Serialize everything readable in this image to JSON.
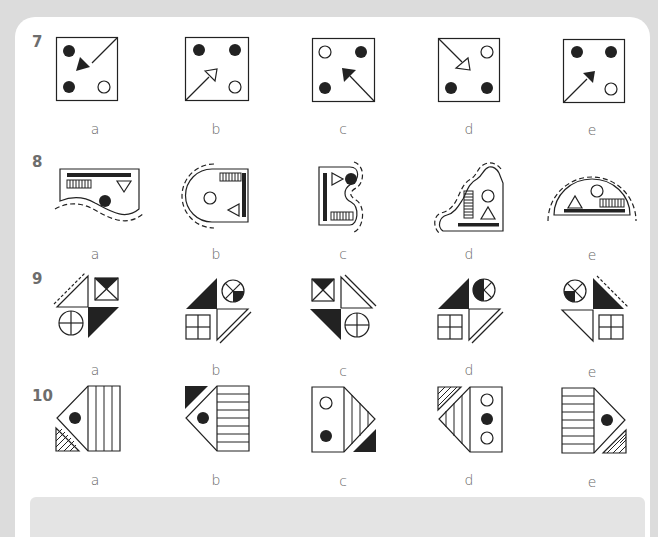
{
  "questions": [
    {
      "number": "7",
      "options": [
        "a",
        "b",
        "c",
        "d",
        "e"
      ]
    },
    {
      "number": "8",
      "options": [
        "a",
        "b",
        "c",
        "d",
        "e"
      ]
    },
    {
      "number": "9",
      "options": [
        "a",
        "b",
        "c",
        "d",
        "e"
      ]
    },
    {
      "number": "10",
      "options": [
        "a",
        "b",
        "c",
        "d",
        "e"
      ]
    }
  ],
  "colors": {
    "background": "#dcdcdc",
    "card": "#ffffff",
    "ink": "#222222",
    "label": "#666666",
    "number": "#6d6d6d"
  },
  "figures": {
    "q7": {
      "a": "square; filled dots top-left, bottom-left; hollow dot bottom-right; filled arrow from top-right corner pointing to centre",
      "b": "square; filled dots top-left, top-right; hollow dot bottom-right; hollow arrow from bottom-left corner pointing to centre",
      "c": "square; hollow dot top-left; filled dots top-right, bottom-left; filled arrow from bottom-right corner pointing to centre",
      "d": "square; hollow dot top-right; filled dots bottom-left, bottom-right; hollow arrow from top-left corner pointing to centre",
      "e": "square; filled dots top-left, top-right; hollow dot bottom-right; filled arrow from bottom-left corner pointing to centre"
    },
    "q8": {
      "a": "wavy bottom edge with dashed outline; bar, striped box, down triangle, filled circle",
      "b": "semicircle left with dashed outline; striped box, vertical bar, circle, left triangle",
      "c": "S-curve right with dashed outline; vertical bar, right triangle, filled circle, striped box",
      "d": "wavy diagonal with dashed outline; vertical striped box, circle, triangle, bar",
      "e": "semicircle top with dashed outline; triangle, circle, striped box, bar"
    },
    "q9": {
      "a": "dashed-edge white triangle, hourglass square, crossed circle, black triangle",
      "b": "black triangle, quartered circle, window square, double-edge white triangle",
      "c": "hourglass square, double-edge white triangle, black triangle, crossed circle",
      "d": "black triangle, quartered circle, window square, double-edge white triangle",
      "e": "quartered circle, dashed-edge black triangle, white triangle, window square"
    },
    "q10": {
      "a": "arrow-left with vertical stripes, dot, hatched corner bottom-left",
      "b": "arrow-left with horizontal stripes, dot, black corner top-left",
      "c": "rect with two dots, arrow-right stripes, black corner bottom-right",
      "d": "arrow-left stripes, rect with three dots, hatched corner top-left",
      "e": "horizontal-striped rect, arrow-right with dot, hatched corner bottom-right"
    }
  }
}
